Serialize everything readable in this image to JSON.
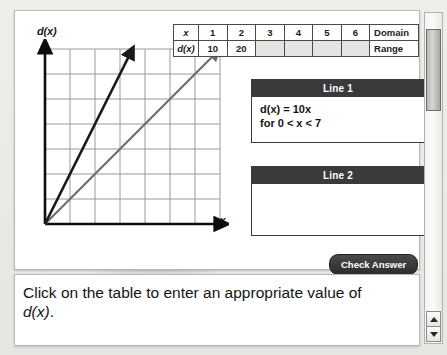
{
  "table": {
    "row_labels": [
      "x",
      "d(x)"
    ],
    "x_values": [
      "1",
      "2",
      "3",
      "4",
      "5",
      "6"
    ],
    "d_values": [
      "10",
      "20",
      "",
      "",
      "",
      ""
    ],
    "side_labels": [
      "Domain",
      "Range"
    ]
  },
  "cards": [
    {
      "title": "Line 1",
      "line1": "d(x) = 10x",
      "line2": "for 0 < x < 7"
    },
    {
      "title": "Line 2",
      "line1": "",
      "line2": ""
    }
  ],
  "buttons": {
    "check_answer": "Check Answer"
  },
  "instruction": {
    "text_part1": "Click on the table to enter an appropriate value of ",
    "text_fn": "d(x)",
    "text_part2": "."
  },
  "graph": {
    "y_axis_label": "d(x)",
    "x_axis_label": "x",
    "grid_columns": 7,
    "grid_rows": 7,
    "lines": [
      {
        "name": "steep-dark-line",
        "color": "#1a1a1a",
        "slope_cells": 2.0
      },
      {
        "name": "shallow-gray-line",
        "color": "#6d6d6d",
        "slope_cells": 1.0
      }
    ]
  },
  "colors": {
    "card_header": "#3a3a3a",
    "button": "#2c2c2c",
    "panel_border": "#b9b7b2",
    "grid": "#9a9a9a"
  },
  "scrollbar": {
    "up_arrow": "▲",
    "down_arrow": "▼"
  }
}
